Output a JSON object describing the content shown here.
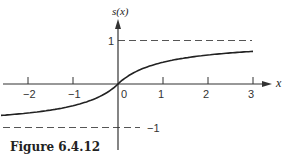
{
  "figure": {
    "caption": "Figure 6.4.12"
  },
  "chart_data": {
    "type": "line",
    "title": "",
    "xlabel": "x",
    "ylabel": "s(x)",
    "xlim": [
      -2.6,
      3.1
    ],
    "ylim": [
      -1.3,
      1.5
    ],
    "x_ticks": [
      -2,
      -1,
      0,
      1,
      2,
      3
    ],
    "x_tick_labels": [
      "−2",
      "−1",
      "0",
      "1",
      "2",
      "3"
    ],
    "y_ticks": [
      1,
      -1
    ],
    "y_tick_labels": [
      "1",
      "−1"
    ],
    "asymptotes": [
      {
        "y": 1,
        "style": "dashed"
      },
      {
        "y": -1,
        "style": "dashed"
      }
    ],
    "series": [
      {
        "name": "s(x)",
        "x": [
          -2.6,
          -2,
          -1.5,
          -1,
          -0.5,
          0,
          0.5,
          1,
          1.5,
          2,
          2.5,
          3
        ],
        "values": [
          -0.72,
          -0.67,
          -0.6,
          -0.5,
          -0.33,
          0,
          0.33,
          0.5,
          0.6,
          0.67,
          0.71,
          0.75
        ]
      }
    ],
    "grid": false,
    "legend": null
  }
}
